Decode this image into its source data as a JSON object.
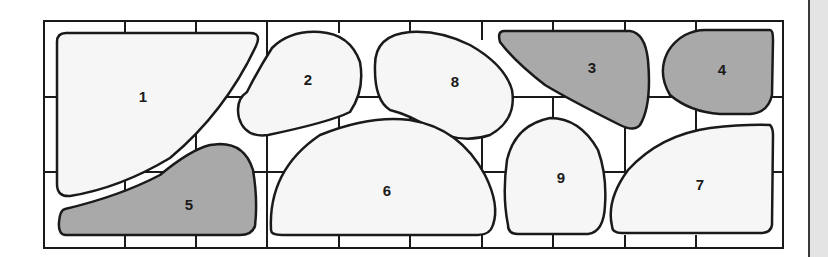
{
  "diagram": {
    "type": "numbered-shape-layout",
    "colors": {
      "outline": "#1a1a1a",
      "light_fill": "#f6f6f6",
      "shaded_fill": "#a9a9a9",
      "background": "#ffffff",
      "side_strip": "#e4e4e4"
    },
    "shapes": [
      {
        "id": 1,
        "label": "1",
        "shaded": false
      },
      {
        "id": 2,
        "label": "2",
        "shaded": false
      },
      {
        "id": 3,
        "label": "3",
        "shaded": true
      },
      {
        "id": 4,
        "label": "4",
        "shaded": true
      },
      {
        "id": 5,
        "label": "5",
        "shaded": true
      },
      {
        "id": 6,
        "label": "6",
        "shaded": false
      },
      {
        "id": 7,
        "label": "7",
        "shaded": false
      },
      {
        "id": 8,
        "label": "8",
        "shaded": false
      },
      {
        "id": 9,
        "label": "9",
        "shaded": false
      }
    ]
  }
}
